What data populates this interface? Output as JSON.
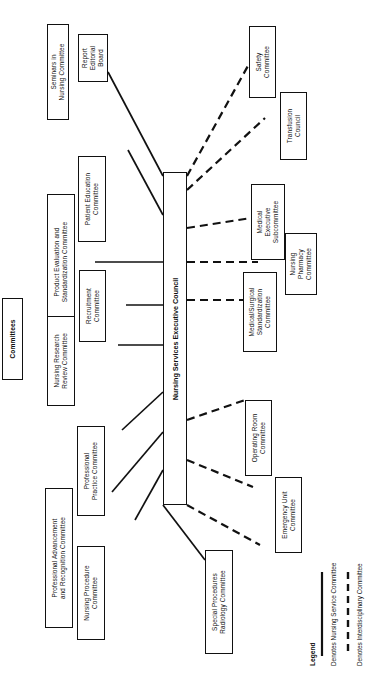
{
  "diagram": {
    "header_label": "Committees",
    "root": {
      "label": "Nursing Services Executive Council"
    },
    "legend": {
      "title": "Legend",
      "items": [
        {
          "style": "solid",
          "label": "Denotes Nursing Service Committee"
        },
        {
          "style": "dashed",
          "label": "Denotes Interdisciplinary Committee"
        }
      ]
    },
    "nursing_service_committees": [
      {
        "id": "seminars-in-nursing",
        "label": "Seminars in\nNursing Committee"
      },
      {
        "id": "report-editorial-board",
        "label": "Report\nEditorial\nBoard"
      },
      {
        "id": "patient-education",
        "label": "Patient Education\nCommittee"
      },
      {
        "id": "product-evaluation",
        "label": "Product Evaluation and\nStandardization Committee"
      },
      {
        "id": "recruitment",
        "label": "Recruitment\nCommittee"
      },
      {
        "id": "nursing-research-review",
        "label": "Nursing Research\nReview Committee"
      },
      {
        "id": "professional-practice",
        "label": "Professional\nPractice Committee"
      },
      {
        "id": "professional-advancement",
        "label": "Professional Advancement\nand Recognition Committee"
      },
      {
        "id": "nursing-procedure",
        "label": "Nursing Procedure\nCommittee"
      }
    ],
    "interdisciplinary_committees": [
      {
        "id": "safety",
        "label": "Safety\nCommittee"
      },
      {
        "id": "transfusion-council",
        "label": "Transfusion\nCouncil"
      },
      {
        "id": "medical-executive-sub",
        "label": "Medical\nExecutive\nSubcommittee"
      },
      {
        "id": "nursing-pharmacy",
        "label": "Nursing\nPharmacy\nCommittee"
      },
      {
        "id": "medsurg-standardization",
        "label": "Medical/Surgical\nStandardization\nCommittee"
      },
      {
        "id": "operating-room",
        "label": "Operating Room\nCommittee"
      },
      {
        "id": "emergency-unit",
        "label": "Emergency Unit\nCommittee"
      },
      {
        "id": "special-procedures-radiology",
        "label": "Special Procedures\nRadiology Committee"
      }
    ],
    "colors": {
      "stroke": "#111111",
      "fill": "#ffffff"
    }
  }
}
